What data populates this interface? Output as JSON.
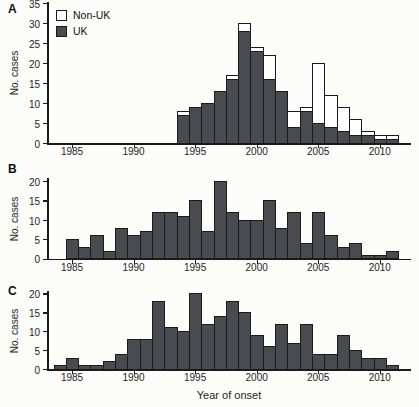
{
  "figure": {
    "xlabel": "Year of onset",
    "ylabel": "No. cases",
    "colors": {
      "uk_fill": "#4a4a51",
      "nonuk_fill": "#ffffff",
      "border": "#1a1a1a",
      "background": "#fcfcf9"
    },
    "legend": [
      {
        "label": "Non-UK",
        "series": "Non-UK"
      },
      {
        "label": "UK",
        "series": "UK"
      }
    ]
  },
  "chart_data": [
    {
      "panel": "A",
      "type": "bar",
      "stacked": true,
      "ylabel": "No. cases",
      "ylim": [
        0,
        35
      ],
      "yticks": [
        0,
        5,
        10,
        15,
        20,
        25,
        30,
        35
      ],
      "xticks": [
        1985,
        1990,
        1995,
        2000,
        2005,
        2010
      ],
      "xlim": [
        1983,
        2012
      ],
      "years": [
        1994,
        1995,
        1996,
        1997,
        1998,
        1999,
        2000,
        2001,
        2002,
        2003,
        2004,
        2005,
        2006,
        2007,
        2008,
        2009,
        2010,
        2011
      ],
      "series": [
        {
          "name": "UK",
          "values": [
            7,
            9,
            10,
            13,
            16,
            28,
            23,
            16,
            13,
            4,
            8,
            5,
            4,
            3,
            2,
            2,
            1,
            1
          ]
        },
        {
          "name": "Non-UK",
          "values": [
            1,
            0,
            0,
            0,
            1,
            2,
            1,
            6,
            0,
            4,
            1,
            15,
            8,
            6,
            4,
            1,
            1,
            1
          ]
        }
      ],
      "legend_position": "upper-left",
      "grid": false
    },
    {
      "panel": "B",
      "type": "bar",
      "stacked": false,
      "ylabel": "No. cases",
      "ylim": [
        0,
        20
      ],
      "yticks": [
        0,
        5,
        10,
        15,
        20
      ],
      "xticks": [
        1985,
        1990,
        1995,
        2000,
        2005,
        2010
      ],
      "xlim": [
        1983,
        2012
      ],
      "years": [
        1985,
        1986,
        1987,
        1988,
        1989,
        1990,
        1991,
        1992,
        1993,
        1994,
        1995,
        1996,
        1997,
        1998,
        1999,
        2000,
        2001,
        2002,
        2003,
        2004,
        2005,
        2006,
        2007,
        2008,
        2009,
        2010,
        2011
      ],
      "series": [
        {
          "name": "cases",
          "values": [
            5,
            3,
            6,
            2,
            8,
            6,
            7,
            12,
            12,
            11,
            15,
            7,
            20,
            12,
            10,
            10,
            15,
            8,
            12,
            4,
            12,
            6,
            3,
            4,
            1,
            1,
            2
          ]
        }
      ],
      "grid": false
    },
    {
      "panel": "C",
      "type": "bar",
      "stacked": false,
      "ylabel": "No. cases",
      "xlabel": "Year of onset",
      "ylim": [
        0,
        20
      ],
      "yticks": [
        0,
        5,
        10,
        15,
        20
      ],
      "xticks": [
        1985,
        1990,
        1995,
        2000,
        2005,
        2010
      ],
      "xlim": [
        1983,
        2012
      ],
      "years": [
        1984,
        1985,
        1986,
        1987,
        1988,
        1989,
        1990,
        1991,
        1992,
        1993,
        1994,
        1995,
        1996,
        1997,
        1998,
        1999,
        2000,
        2001,
        2002,
        2003,
        2004,
        2005,
        2006,
        2007,
        2008,
        2009,
        2010,
        2011
      ],
      "series": [
        {
          "name": "cases",
          "values": [
            1,
            3,
            1,
            1,
            2,
            4,
            8,
            8,
            18,
            11,
            10,
            20,
            12,
            14,
            18,
            15,
            9,
            6,
            12,
            7,
            12,
            4,
            4,
            9,
            5,
            3,
            3,
            1
          ]
        }
      ],
      "grid": false
    }
  ]
}
